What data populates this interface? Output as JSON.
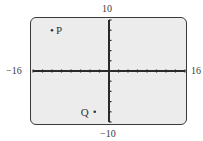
{
  "chart_data": {
    "type": "scatter",
    "title": "",
    "xlabel": "",
    "ylabel": "",
    "xlim": [
      -16,
      16
    ],
    "ylim": [
      -10,
      10
    ],
    "x_tick_step": 2,
    "y_tick_step": 2,
    "grid": false,
    "window_labels": {
      "xmin": "−16",
      "xmax": "16",
      "ymin": "−10",
      "ymax": "10"
    },
    "points": [
      {
        "label": "P",
        "x": -12,
        "y": 8
      },
      {
        "label": "Q",
        "x": -3,
        "y": -8
      }
    ],
    "colors": {
      "screen_bg": "#ececec",
      "axis": "#2a2a2a",
      "frame": "#3a3a3a"
    }
  }
}
